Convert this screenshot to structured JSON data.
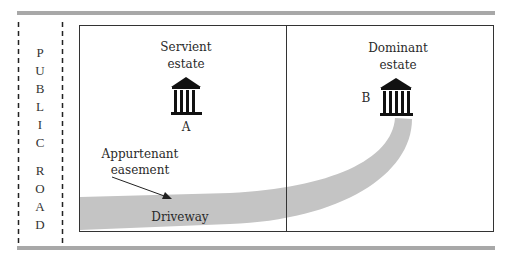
{
  "diagram": {
    "road_label_letters": [
      "P",
      "U",
      "B",
      "L",
      "I",
      "C",
      "",
      "R",
      "O",
      "A",
      "D"
    ],
    "road_label": "PUBLIC ROAD",
    "servient": {
      "title_line1": "Servient",
      "title_line2": "estate",
      "marker": "A",
      "icon": "building-icon"
    },
    "dominant": {
      "title_line1": "Dominant",
      "title_line2": "estate",
      "marker": "B",
      "icon": "building-icon"
    },
    "easement_label_line1": "Appurtenant",
    "easement_label_line2": "easement",
    "driveway_label": "Driveway",
    "colors": {
      "rule": "#a8a8a8",
      "driveway": "#c4c4c4",
      "frame": "#333333",
      "icon": "#111111"
    }
  }
}
